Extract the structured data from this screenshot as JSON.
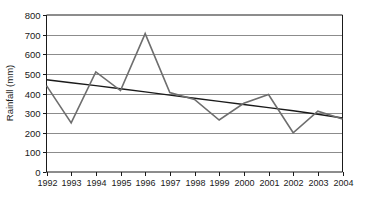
{
  "chart_data": {
    "type": "line",
    "title": "",
    "xlabel": "",
    "ylabel": "Rainfall (mm)",
    "ylim": [
      0,
      800
    ],
    "ytick_step": 100,
    "yticks": [
      "0",
      "100",
      "200",
      "300",
      "400",
      "500",
      "600",
      "700",
      "800"
    ],
    "grid": true,
    "legend": "none",
    "categories": [
      "1992",
      "1993",
      "1994",
      "1995",
      "1996",
      "1997",
      "1998",
      "1999",
      "2000",
      "2001",
      "2002",
      "2003",
      "2004"
    ],
    "series": [
      {
        "name": "Rainfall",
        "kind": "data-line",
        "color": "#6e6e6e",
        "values": [
          440,
          250,
          510,
          415,
          705,
          405,
          370,
          265,
          350,
          395,
          200,
          310,
          270
        ]
      },
      {
        "name": "Trend line",
        "kind": "trend-line",
        "color": "#1a1a1a",
        "values": [
          470,
          455,
          440,
          424,
          408,
          392,
          376,
          360,
          344,
          328,
          312,
          294,
          275
        ]
      }
    ]
  },
  "axes": {
    "y_title": "Rainfall (mm)",
    "y_tick_values": [
      800,
      700,
      600,
      500,
      400,
      300,
      200,
      100,
      0
    ],
    "x_tick_values": [
      "1992",
      "1993",
      "1994",
      "1995",
      "1996",
      "1997",
      "1998",
      "1999",
      "2000",
      "2001",
      "2002",
      "2003",
      "2004"
    ]
  },
  "colors": {
    "data_line": "#6e6e6e",
    "trend_line": "#1a1a1a",
    "gridline": "#8c8c8c",
    "axis": "#1a1a1a",
    "background": "#ffffff",
    "text": "#1a1a1a"
  }
}
